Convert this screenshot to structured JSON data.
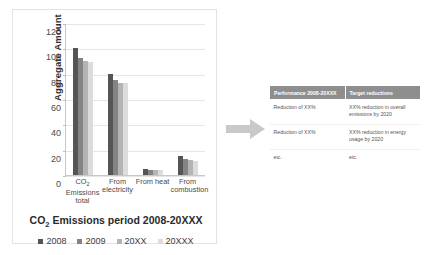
{
  "chart_data": {
    "type": "bar",
    "title": "CO2 Emissions period 2008-20XXX",
    "title_prefix": "CO",
    "title_sub": "2",
    "title_suffix": " Emissions period 2008-20XXX",
    "xlabel": "CO2 Emissions period 2008-20XXX",
    "ylabel": "Aggregate Amount",
    "ylabel_prefix": "Aggregate Amount",
    "ylim": [
      0,
      120
    ],
    "yticks": [
      0,
      20,
      40,
      60,
      80,
      100,
      120
    ],
    "grid": true,
    "legend_position": "bottom",
    "categories": [
      "CO2 Emissions total",
      "From electricity",
      "From heat",
      "From combustion"
    ],
    "category_lines": [
      [
        "CO",
        "2",
        " Emissions",
        "total"
      ],
      [
        "From",
        "electricity"
      ],
      [
        "From heat"
      ],
      [
        "From",
        "combustion"
      ]
    ],
    "series": [
      {
        "name": "2008",
        "color": "#555555",
        "values": [
          100,
          80,
          5,
          15
        ]
      },
      {
        "name": "2009",
        "color": "#848484",
        "values": [
          92,
          75,
          4,
          13
        ]
      },
      {
        "name": "20XX",
        "color": "#b4b4b4",
        "values": [
          90,
          73,
          4,
          12
        ]
      },
      {
        "name": "20XXX",
        "color": "#dcdcdc",
        "values": [
          89,
          73,
          4,
          11
        ]
      }
    ]
  },
  "arrow": {
    "name": "flow-arrow",
    "color": "#c9c9c9",
    "direction": "right"
  },
  "table": {
    "headers": [
      "Performance 2008-20XXX",
      "Target reductions"
    ],
    "rows": [
      [
        "Reduction of XX%",
        "XX% reduction in overall emissions by 2020"
      ],
      [
        "Reduction of XX%",
        "XX% reduction in energy usage by 2020"
      ],
      [
        "etc.",
        "etc."
      ]
    ],
    "header_bg": "#8e8e8e",
    "header_color": "#ffffff"
  }
}
